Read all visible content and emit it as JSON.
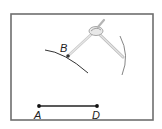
{
  "diagram": {
    "type": "compass-construction",
    "frame": {
      "x": 11,
      "y": 14,
      "width": 142,
      "height": 106,
      "stroke": "#6e6e6e"
    },
    "points": [
      {
        "id": "B",
        "label": "B",
        "x": 68,
        "y": 56
      },
      {
        "id": "A",
        "label": "A",
        "x": 39,
        "y": 106
      },
      {
        "id": "D",
        "label": "D",
        "x": 97,
        "y": 106
      }
    ],
    "segments": [
      {
        "from": "A",
        "to": "D"
      }
    ],
    "arcs": [
      {
        "name": "arc-through-B",
        "path": "M45,50 Q64,52 88,73"
      },
      {
        "name": "arc-right",
        "path": "M120,36 Q130,55 122,75"
      }
    ],
    "compass": {
      "hinge": {
        "x": 95,
        "y": 31
      },
      "handle_tip": {
        "x": 104,
        "y": 20
      },
      "leg_left_end": {
        "x": 68,
        "y": 56
      },
      "leg_right_end": {
        "x": 124,
        "y": 57
      },
      "color": "#bdbdbd"
    },
    "colors": {
      "ink": "#222222",
      "point": "#333333"
    }
  }
}
